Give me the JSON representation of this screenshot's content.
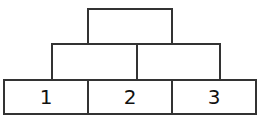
{
  "diagram": {
    "type": "number-pyramid",
    "rows": [
      {
        "row": "top",
        "cells": [
          ""
        ]
      },
      {
        "row": "middle",
        "cells": [
          "",
          ""
        ]
      },
      {
        "row": "bottom",
        "cells": [
          "1",
          "2",
          "3"
        ]
      }
    ]
  }
}
